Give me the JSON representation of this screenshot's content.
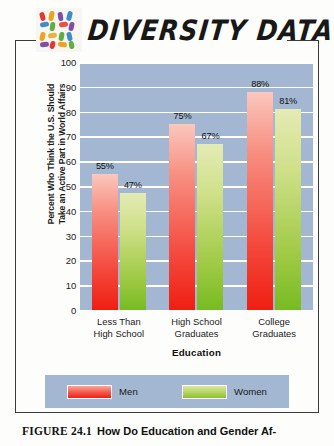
{
  "header": {
    "logo_icon": "diversity-mosaic-icon",
    "brand_title": "DIVERSITY DATA"
  },
  "chart_data": {
    "type": "bar",
    "title": "",
    "categories": [
      "Less Than\nHigh School",
      "High School\nGraduates",
      "College\nGraduates"
    ],
    "category_lines": [
      [
        "Less Than",
        "High School"
      ],
      [
        "High School",
        "Graduates"
      ],
      [
        "College",
        "Graduates"
      ]
    ],
    "series": [
      {
        "name": "Men",
        "color": "#f4463a",
        "values": [
          55,
          75,
          88
        ],
        "labels": [
          "55%",
          "75%",
          "88%"
        ]
      },
      {
        "name": "Women",
        "color": "#9ec943",
        "values": [
          47,
          67,
          81
        ],
        "labels": [
          "47%",
          "67%",
          "81%"
        ]
      }
    ],
    "xlabel": "Education",
    "ylabel": "Percent Who Think the U.S. Should Take an Active Part in World Affairs",
    "ylabel_lines": [
      "Percent Who Think the U.S. Should",
      "Take an Active Part in World Affairs"
    ],
    "ylim": [
      0,
      100
    ],
    "ytick_values": [
      100,
      90,
      80,
      70,
      60,
      50,
      40,
      30,
      20,
      10,
      0
    ],
    "yticks": [
      "100",
      "90",
      "80",
      "70",
      "60",
      "50",
      "40",
      "30",
      "20",
      "10",
      "0"
    ],
    "grid": true,
    "legend_position": "bottom",
    "plot_background": "#a3b7d2",
    "gridline_color": "#ffffff"
  },
  "legend": {
    "items": [
      {
        "label": "Men",
        "color": "#f4463a"
      },
      {
        "label": "Women",
        "color": "#9ec943"
      }
    ]
  },
  "caption": {
    "figure_number": "FIGURE 24.1",
    "text": "How Do Education and Gender Af-"
  }
}
